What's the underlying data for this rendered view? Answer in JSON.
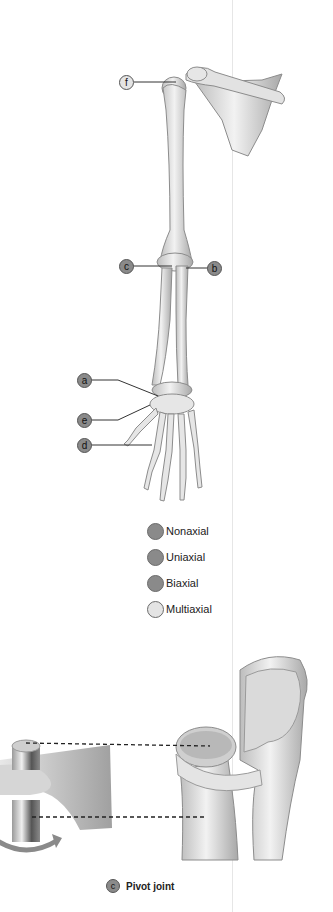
{
  "figure": {
    "callouts": [
      {
        "id": "f",
        "label": "f",
        "fill": "#e4e4e4",
        "location": "shoulder"
      },
      {
        "id": "c",
        "label": "c",
        "fill": "#8a8a8a",
        "location": "elbow-left"
      },
      {
        "id": "b",
        "label": "b",
        "fill": "#8a8a8a",
        "location": "elbow-right"
      },
      {
        "id": "a",
        "label": "a",
        "fill": "#8a8a8a",
        "location": "wrist"
      },
      {
        "id": "e",
        "label": "e",
        "fill": "#8a8a8a",
        "location": "thumb-base"
      },
      {
        "id": "d",
        "label": "d",
        "fill": "#8a8a8a",
        "location": "knuckles"
      }
    ],
    "legend": [
      {
        "label": "Nonaxial",
        "color": "#8a8a8a"
      },
      {
        "label": "Uniaxial",
        "color": "#8a8a8a"
      },
      {
        "label": "Biaxial",
        "color": "#8a8a8a"
      },
      {
        "label": "Multiaxial",
        "color": "#e4e4e4"
      }
    ],
    "caption": {
      "letter": "c",
      "text": "Pivot joint"
    }
  },
  "colors": {
    "bone_light": "#ececec",
    "bone_mid": "#c8c8c8",
    "bone_dark": "#9a9a9a",
    "callout_dark": "#8a8a8a",
    "callout_light": "#e4e4e4"
  }
}
